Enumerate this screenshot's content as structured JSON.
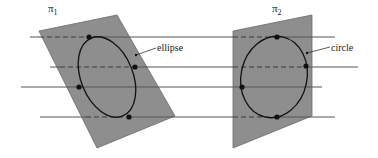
{
  "figure": {
    "colors": {
      "plane_fill": "#8e8e8e",
      "plane_stroke": "#6a6a6a",
      "line": "#555555",
      "curve": "#111111",
      "point": "#111111",
      "background": "#ffffff"
    },
    "planes": [
      {
        "id": "plane1",
        "label": "π1",
        "label_base": "π",
        "label_sub": "1",
        "label_pos": [
          48,
          12
        ],
        "corners": [
          [
            39,
            31
          ],
          [
            117,
            15
          ],
          [
            175,
            116
          ],
          [
            97,
            148
          ]
        ],
        "curve_label": "ellipse",
        "curve_label_pos": [
          157,
          51
        ],
        "leader": [
          [
            136,
            55
          ],
          [
            156,
            48
          ]
        ],
        "curve": {
          "cx": 107,
          "cy": 77,
          "rx": 26,
          "ry": 42,
          "rotate": -22
        },
        "points": [
          [
            89,
            37
          ],
          [
            135,
            67
          ],
          [
            79,
            87
          ],
          [
            129,
            117
          ]
        ]
      },
      {
        "id": "plane2",
        "label": "π2",
        "label_base": "π",
        "label_sub": "2",
        "label_pos": [
          272,
          12
        ],
        "corners": [
          [
            233,
            31
          ],
          [
            312,
            15
          ],
          [
            312,
            116
          ],
          [
            233,
            148
          ]
        ],
        "curve_label": "circle",
        "curve_label_pos": [
          331,
          51
        ],
        "leader": [
          [
            307,
            53
          ],
          [
            330,
            47
          ]
        ],
        "curve": {
          "cx": 274,
          "cy": 77,
          "rx": 33,
          "ry": 41,
          "rotate": 12
        },
        "points": [
          [
            277,
            37
          ],
          [
            306,
            66
          ],
          [
            242,
            87
          ],
          [
            277,
            117
          ]
        ]
      }
    ],
    "lines": [
      {
        "y": 37,
        "x_start": 30,
        "x_end": 335,
        "dashed": [
          [
            39,
            89
          ],
          [
            233,
            277
          ]
        ]
      },
      {
        "y": 67,
        "x_start": 50,
        "x_end": 358,
        "dashed": [
          [
            60,
            135
          ],
          [
            233,
            306
          ]
        ]
      },
      {
        "y": 87,
        "x_start": 21,
        "x_end": 322,
        "dashed": []
      },
      {
        "y": 117,
        "x_start": 40,
        "x_end": 335,
        "dashed": [
          [
            86,
            129
          ],
          [
            233,
            277
          ]
        ]
      }
    ]
  }
}
